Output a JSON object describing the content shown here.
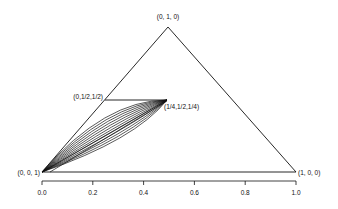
{
  "diagram": {
    "type": "ternary-simplex",
    "vertices": {
      "top": "(0, 1, 0)",
      "left": "(0, 0, 1)",
      "right": "(1, 0, 0)"
    },
    "point_labels": {
      "edge_mid": "(0,1/2,1/2)",
      "inner": "(1/4,1/2,1/4)"
    },
    "axis_ticks": [
      "0.0",
      "0.2",
      "0.4",
      "0.6",
      "0.8",
      "1.0"
    ],
    "curve_count": 12
  }
}
